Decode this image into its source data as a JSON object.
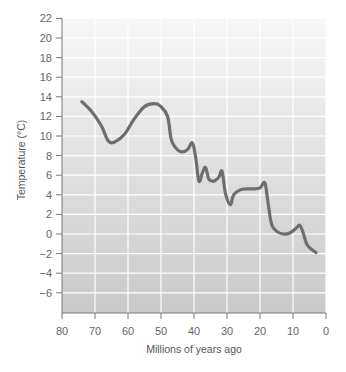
{
  "chart_data": {
    "type": "line",
    "title": "",
    "xlabel": "Millions of years ago",
    "ylabel": "Temperature (°C)",
    "xlim": [
      80,
      0
    ],
    "ylim": [
      -8,
      22
    ],
    "x_ticks": [
      80,
      70,
      60,
      50,
      40,
      30,
      20,
      10,
      0
    ],
    "y_ticks": [
      22,
      20,
      18,
      16,
      14,
      12,
      10,
      8,
      6,
      4,
      2,
      0,
      -2,
      -4,
      -6
    ],
    "grid": true,
    "legend": null,
    "series": [
      {
        "name": "Temperature",
        "color": "#6e6e6e",
        "x": [
          74,
          71,
          68,
          66,
          64,
          61,
          58,
          55,
          52,
          50,
          48,
          47,
          46,
          44,
          42,
          40.5,
          39.5,
          38.5,
          37.5,
          36.5,
          35.5,
          34,
          32.5,
          31.5,
          30.5,
          29,
          28,
          26,
          24,
          22,
          20,
          18.5,
          17.5,
          16.5,
          15,
          13,
          11,
          9,
          8,
          7,
          6,
          5,
          3
        ],
        "values": [
          13.5,
          12.5,
          11,
          9.5,
          9.4,
          10.2,
          11.8,
          13.0,
          13.3,
          13.0,
          12.0,
          9.8,
          9.0,
          8.4,
          8.6,
          9.3,
          7.8,
          5.4,
          6.2,
          6.8,
          5.6,
          5.4,
          5.8,
          6.4,
          4.2,
          3.0,
          4.0,
          4.5,
          4.6,
          4.6,
          4.7,
          5.2,
          3.0,
          1.0,
          0.3,
          0.0,
          0.1,
          0.6,
          0.9,
          0.2,
          -0.9,
          -1.4,
          -1.9
        ]
      }
    ]
  }
}
